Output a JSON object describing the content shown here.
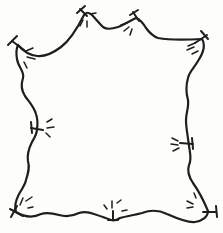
{
  "figure": {
    "background_color": "#fdfdfb",
    "ink_color": "#1e1e1e",
    "canvas": {
      "width": 223,
      "height": 233
    },
    "outline": {
      "stroke_width": 2.2,
      "path": "M 18 45 C 23 51 29 55 37 56 C 45 57 53 53 61 47 C 69 41 78 27 84 15 C 86 12 89 12 92 15 C 95 18 99 23 103 27 C 107 30 112 29 118 27 C 123 25 130 21 136 18 C 139 19 143 23 146 28 C 149 32 152 36 158 38 C 168 40 185 40 202 39 C 205 44 204 52 198 61 C 194 68 189 72 188 78 C 186 85 186 93 188 100 C 189 107 186 113 186 120 C 186 128 188 137 189 146 C 190 153 192 159 189 165 C 187 171 189 177 193 183 C 198 190 203 199 208 211 C 208 217 202 221 195 222 C 187 223 176 218 167 214 C 159 210 150 210 142 213 C 135 215 127 216 120 218 C 117 220 114 221 111 220 C 106 218 100 216 94 214 C 89 212 85 211 79 213 C 73 216 66 217 59 215 C 52 213 47 212 41 214 C 35 217 26 218 16 212 C 14 207 16 200 19 194 C 22 189 25 185 26 180 C 28 174 30 168 28 161 C 27 155 29 148 32 142 C 35 137 37 134 37 129 C 38 123 38 120 36 114 C 34 107 30 103 25 96 C 21 90 21 84 23 78 C 25 72 18 67 17 59 C 16 53 16 49 18 45 Z"
    },
    "stake_stroke_width": 2,
    "ray_stroke_width": 1.5,
    "stakes": [
      {
        "name": "top-left-corner",
        "stem": [
          24,
          50,
          12,
          41
        ],
        "bar": [
          8,
          45,
          17,
          36
        ],
        "rays": [
          [
            26,
            51,
            33,
            48
          ],
          [
            27,
            57,
            35,
            59
          ],
          [
            24,
            62,
            27,
            68
          ]
        ]
      },
      {
        "name": "top-bump-left",
        "stem": [
          87,
          16,
          80,
          9
        ],
        "bar": [
          77,
          13,
          85,
          6
        ],
        "rays": [
          [
            83,
            20,
            80,
            26
          ],
          [
            87,
            21,
            87,
            27
          ],
          [
            90,
            14,
            96,
            13
          ]
        ]
      },
      {
        "name": "top-bump-right",
        "stem": [
          139,
          21,
          133,
          12
        ],
        "bar": [
          130,
          15,
          138,
          10
        ],
        "rays": [
          [
            121,
            25,
            127,
            23
          ],
          [
            124,
            31,
            129,
            27
          ],
          [
            130,
            35,
            132,
            29
          ]
        ]
      },
      {
        "name": "top-right-corner",
        "stem": [
          195,
          43,
          207,
          35
        ],
        "bar": [
          201,
          31,
          208,
          39
        ],
        "rays": [
          [
            188,
            46,
            195,
            43
          ],
          [
            187,
            50,
            194,
            47
          ],
          [
            192,
            54,
            198,
            51
          ]
        ]
      },
      {
        "name": "left-middle",
        "stem": [
          31,
          128,
          43,
          130
        ],
        "bar": [
          31,
          122,
          32,
          133
        ],
        "rays": [
          [
            47,
            122,
            52,
            119
          ],
          [
            47,
            128,
            54,
            127
          ],
          [
            46,
            133,
            50,
            137
          ]
        ]
      },
      {
        "name": "right-middle",
        "stem": [
          180,
          143,
          193,
          144
        ],
        "bar": [
          192,
          138,
          193,
          149
        ],
        "rays": [
          [
            172,
            138,
            178,
            141
          ],
          [
            171,
            144,
            178,
            145
          ],
          [
            173,
            151,
            179,
            148
          ]
        ]
      },
      {
        "name": "bottom-left-corner",
        "stem": [
          23,
          216,
          10,
          209
        ],
        "bar": [
          11,
          217,
          17,
          206
        ],
        "rays": [
          [
            20,
            205,
            23,
            198
          ],
          [
            26,
            201,
            32,
            197
          ],
          [
            28,
            208,
            33,
            207
          ]
        ]
      },
      {
        "name": "bottom-center",
        "stem": [
          113,
          211,
          113,
          220
        ],
        "bar": [
          108,
          220,
          118,
          220
        ],
        "rays": [
          [
            107,
            209,
            104,
            205
          ],
          [
            112,
            208,
            112,
            201
          ],
          [
            117,
            203,
            121,
            200
          ],
          [
            122,
            211,
            127,
            210
          ]
        ]
      },
      {
        "name": "bottom-right-corner",
        "stem": [
          203,
          212,
          216,
          212
        ],
        "bar": [
          216,
          206,
          217,
          217
        ],
        "rays": [
          [
            187,
            201,
            193,
            204
          ],
          [
            187,
            208,
            193,
            207
          ],
          [
            196,
            198,
            194,
            193
          ]
        ]
      }
    ]
  }
}
